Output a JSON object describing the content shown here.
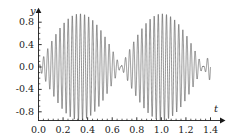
{
  "figure": {
    "background_color": "#ffffff",
    "curve_color": "#3b3b3b",
    "axis_color": "#1a1a1a"
  },
  "axes": {
    "x_name": "t",
    "y_name": "y",
    "x_ticks": [
      "0.0",
      "0.2",
      "0.4",
      "0.6",
      "0.8",
      "1.0",
      "1.2",
      "1.4"
    ],
    "y_ticks": [
      "0.8",
      "0.4",
      "0.0",
      "-0.4",
      "-0.8"
    ]
  },
  "chart_data": {
    "type": "line",
    "title": "",
    "xlabel": "t",
    "ylabel": "y",
    "xlim": [
      0,
      1.4
    ],
    "ylim": [
      -1.0,
      1.0
    ],
    "grid": false,
    "legend": "none",
    "x_ticks": [
      0.0,
      0.2,
      0.4,
      0.6,
      0.8,
      1.0,
      1.2,
      1.4
    ],
    "y_ticks": [
      -0.8,
      -0.4,
      0.0,
      0.4,
      0.8
    ],
    "envelope": {
      "nodes_t": [
        0.335,
        1.005
      ],
      "antinodes_t": [
        0.0,
        0.67,
        1.34
      ],
      "peak_amplitude": 0.95
    },
    "series": [
      {
        "name": "y(t)",
        "carrier_frequency_hz": 60,
        "envelope_frequency_hz": 0.746,
        "amplitude": 0.95,
        "samples_t": [
          0.0,
          0.05,
          0.1,
          0.15,
          0.2,
          0.25,
          0.3,
          0.335,
          0.37,
          0.42,
          0.47,
          0.52,
          0.57,
          0.62,
          0.67,
          0.72,
          0.77,
          0.82,
          0.87,
          0.92,
          0.97,
          1.005,
          1.04,
          1.09,
          1.14,
          1.19,
          1.24,
          1.29,
          1.34,
          1.4
        ],
        "envelope_values": [
          0.95,
          0.92,
          0.83,
          0.7,
          0.54,
          0.36,
          0.15,
          0.0,
          0.15,
          0.38,
          0.58,
          0.75,
          0.88,
          0.94,
          0.95,
          0.94,
          0.88,
          0.75,
          0.58,
          0.38,
          0.15,
          0.0,
          0.15,
          0.38,
          0.58,
          0.75,
          0.88,
          0.94,
          0.95,
          0.88
        ]
      }
    ]
  }
}
